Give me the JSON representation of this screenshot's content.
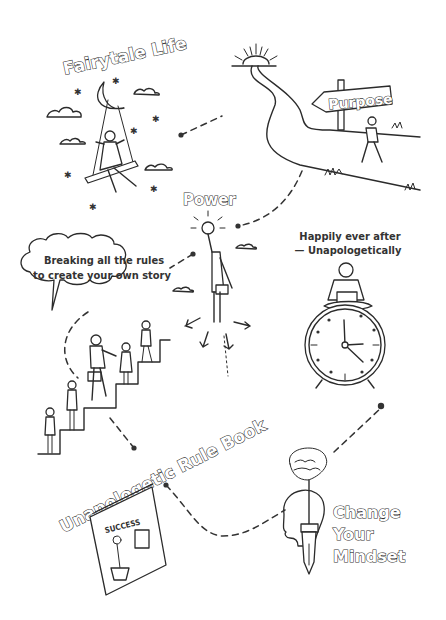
{
  "diagram": {
    "type": "journey-map",
    "style": "hand-drawn line illustration",
    "colors": {
      "ink": "#2b2b2b",
      "background": "#ffffff"
    },
    "nodes": [
      {
        "id": "fairytale",
        "label": "Fairytale Life",
        "icon": "moon-swing-icon"
      },
      {
        "id": "purpose",
        "label": "Purpose",
        "icon": "signpost-icon"
      },
      {
        "id": "power",
        "label": "Power",
        "icon": "flying-woman-lightbulb-icon"
      },
      {
        "id": "breaking",
        "label_line1": "Breaking all the rules",
        "label_line2": "to create your own story",
        "icon": "stairs-people-icon"
      },
      {
        "id": "happily",
        "label_line1": "Happily ever after",
        "label_line2": "— Unapologetically",
        "icon": "clock-woman-laptop-icon"
      },
      {
        "id": "rulebook",
        "label": "Unapologetic Rule Book",
        "icon": "book-icon",
        "book_cover_text": "SUCCESS"
      },
      {
        "id": "mindset",
        "label_line1": "Change",
        "label_line2": "Your",
        "label_line3": "Mindset",
        "icon": "head-brain-pen-icon"
      }
    ],
    "edges": [
      {
        "from": "fairytale",
        "to": "purpose",
        "style": "dashed"
      },
      {
        "from": "purpose",
        "to": "power",
        "style": "dashed"
      },
      {
        "from": "power",
        "to": "breaking",
        "style": "dashed"
      },
      {
        "from": "breaking",
        "to": "rulebook",
        "style": "dashed"
      },
      {
        "from": "rulebook",
        "to": "mindset",
        "style": "dashed"
      },
      {
        "from": "mindset",
        "to": "happily",
        "style": "dashed"
      }
    ]
  }
}
